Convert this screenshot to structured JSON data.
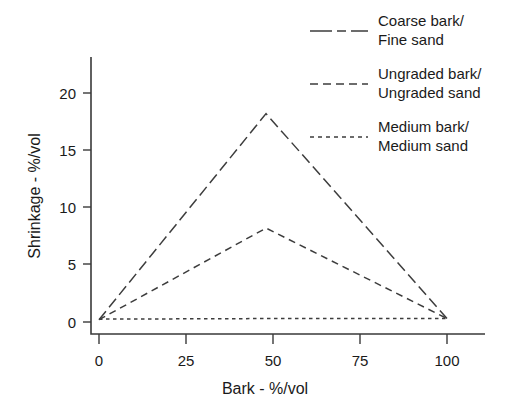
{
  "chart_data": {
    "type": "line",
    "title": "",
    "subtitle": "",
    "xlabel": "Bark - %/vol",
    "ylabel": "Shrinkage - %/vol",
    "xlim": [
      0,
      108
    ],
    "ylim": [
      0,
      22.5
    ],
    "xticks": [
      0,
      25,
      50,
      75,
      100
    ],
    "xticklabels": [
      "0",
      "25",
      "50",
      "75",
      "100"
    ],
    "yticks": [
      0,
      5,
      10,
      15,
      20
    ],
    "yticklabels": [
      "0",
      "5",
      "10",
      "15",
      "20"
    ],
    "grid": false,
    "legend_position": "top-right",
    "series": [
      {
        "name": "Coarse bark/\nFine sand",
        "name_line1": "Coarse bark/",
        "name_line2": "Fine sand",
        "linestyle": "long-dash",
        "color": "#3d3d3d",
        "x": [
          0,
          48,
          100
        ],
        "values": [
          0.2,
          18.2,
          0.3
        ]
      },
      {
        "name": "Ungraded bark/\nUngraded sand",
        "name_line1": "Ungraded bark/",
        "name_line2": "Ungraded sand",
        "linestyle": "dash",
        "color": "#3d3d3d",
        "x": [
          0,
          48,
          100
        ],
        "values": [
          0.2,
          8.2,
          0.3
        ]
      },
      {
        "name": "Medium bark/\nMedium sand",
        "name_line1": "Medium bark/",
        "name_line2": "Medium sand",
        "linestyle": "dot",
        "color": "#3d3d3d",
        "x": [
          0,
          48,
          100
        ],
        "values": [
          0.25,
          0.3,
          0.3
        ]
      }
    ]
  },
  "axes": {
    "x_title": "Bark - %/vol",
    "y_title": "Shrinkage - %/vol",
    "x_tick_0": "0",
    "x_tick_1": "25",
    "x_tick_2": "50",
    "x_tick_3": "75",
    "x_tick_4": "100",
    "y_tick_0": "0",
    "y_tick_1": "5",
    "y_tick_2": "10",
    "y_tick_3": "15",
    "y_tick_4": "20"
  },
  "legend": {
    "entries": [
      {
        "line1": "Coarse bark/",
        "line2": "Fine sand",
        "style": "long-dash"
      },
      {
        "line1": "Ungraded bark/",
        "line2": "Ungraded sand",
        "style": "dash"
      },
      {
        "line1": "Medium bark/",
        "line2": "Medium sand",
        "style": "dot"
      }
    ]
  }
}
